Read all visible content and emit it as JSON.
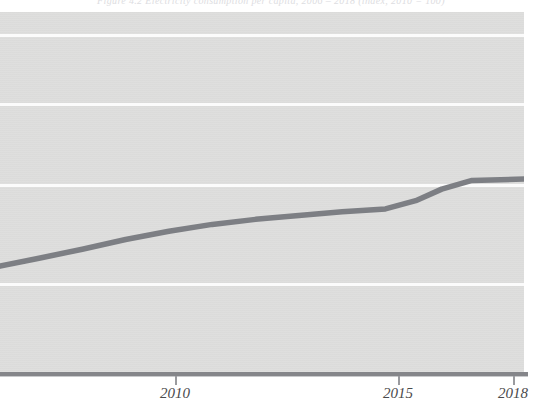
{
  "chart_data": {
    "type": "line",
    "xlabel": "",
    "ylabel": "",
    "grid": true,
    "gridlines_y": [
      80,
      60,
      40,
      20
    ],
    "legend": "none",
    "xlim": [
      2006.1,
      2018.2
    ],
    "ylim": [
      0,
      100
    ],
    "xticks": [
      2010,
      2015,
      2018
    ],
    "xtick_labels": [
      "2010",
      "2015",
      "2018"
    ],
    "series": [
      {
        "name": "Series 1",
        "color": "#7d7f84",
        "x": [
          2006.1,
          2007.0,
          2008.0,
          2009.0,
          2010.0,
          2011.0,
          2012.0,
          2013.0,
          2014.0,
          2015.0,
          2015.7,
          2016.3,
          2017.0,
          2018.2
        ],
        "values": [
          29.4,
          31.6,
          34.1,
          36.8,
          39.1,
          41.0,
          42.4,
          43.5,
          44.5,
          45.3,
          47.6,
          50.8,
          53.2,
          53.6
        ]
      }
    ]
  },
  "chart": {
    "title_text": "Figure 4.2   Electricity consumption per capita, 2006 – 2018   (index, 2010 = 100)",
    "axis": {
      "ticks": [
        {
          "label": "2010",
          "x": 175
        },
        {
          "label": "2015",
          "x": 398
        },
        {
          "label": "2018",
          "x": 513
        }
      ]
    },
    "gridlines": [
      {
        "y": 22
      },
      {
        "y": 91
      },
      {
        "y": 172
      },
      {
        "y": 271
      }
    ],
    "colors": {
      "plot_background": "#dededd",
      "gridline": "#fbfbfb",
      "series_line": "#7d7f84",
      "axis_rule": "#85868a",
      "tick_label": "#4a4a4c",
      "page": "#ffffff"
    },
    "line_path": "M 0,256 L 26,251 L 56,243 L 90,235 L 120,231 L 150,226 L 175,221 L 205,216 L 235,212 L 268,208 L 300,205 L 330,202 L 360,200 L 390,199 L 398,198 L 420,189 L 448,178 L 470,170 L 490,167 L 508,166 L 524,166"
  }
}
